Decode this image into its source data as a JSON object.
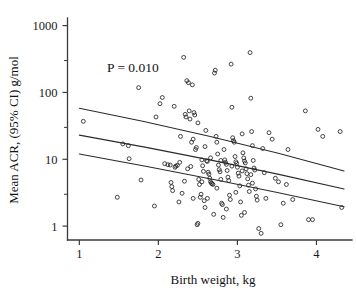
{
  "chart_data": {
    "type": "scatter",
    "title": "",
    "xlabel": "Birth weight, kg",
    "ylabel": "Mean ACR, (95% CI) g/mol",
    "yscale": "log",
    "xscale": "linear",
    "xlim": [
      0.85,
      4.45
    ],
    "ylim": [
      0.62,
      1300
    ],
    "grid": false,
    "legend": null,
    "annotations": [
      {
        "text": "P = 0.010",
        "x": 1.35,
        "y": 200
      }
    ],
    "xticks": [
      1,
      2,
      3,
      4
    ],
    "xtick_labels": [
      "1",
      "2",
      "3",
      "4"
    ],
    "yticks": [
      1,
      10,
      100,
      1000
    ],
    "ytick_labels": [
      "1",
      "10",
      "100",
      "1000"
    ],
    "yminor_ticks": [
      3,
      30,
      300
    ],
    "marker": "open-circle",
    "marker_size": 3,
    "series": [
      {
        "name": "Observations",
        "type": "scatter",
        "points": [
          [
            1.05,
            37
          ],
          [
            1.48,
            2.7
          ],
          [
            1.55,
            17
          ],
          [
            1.62,
            16
          ],
          [
            1.63,
            10.2
          ],
          [
            1.75,
            118
          ],
          [
            1.78,
            4.9
          ],
          [
            1.95,
            2.0
          ],
          [
            1.97,
            43
          ],
          [
            2.02,
            68
          ],
          [
            2.05,
            84
          ],
          [
            2.08,
            8.6
          ],
          [
            2.12,
            8.3
          ],
          [
            2.15,
            8.2
          ],
          [
            2.16,
            4.5
          ],
          [
            2.17,
            3.9
          ],
          [
            2.18,
            3.4
          ],
          [
            2.2,
            62
          ],
          [
            2.22,
            7.9
          ],
          [
            2.24,
            8.1
          ],
          [
            2.26,
            2.3
          ],
          [
            2.28,
            22
          ],
          [
            2.3,
            3.1
          ],
          [
            2.32,
            335
          ],
          [
            2.34,
            47
          ],
          [
            2.35,
            43
          ],
          [
            2.36,
            150
          ],
          [
            2.38,
            140
          ],
          [
            2.39,
            53
          ],
          [
            2.4,
            40
          ],
          [
            2.41,
            7.8
          ],
          [
            2.42,
            18
          ],
          [
            2.43,
            130
          ],
          [
            2.44,
            2.6
          ],
          [
            2.45,
            50
          ],
          [
            2.46,
            46
          ],
          [
            2.47,
            14
          ],
          [
            2.48,
            15
          ],
          [
            2.49,
            1.05
          ],
          [
            2.5,
            1.1
          ],
          [
            2.51,
            5.0
          ],
          [
            2.52,
            4.2
          ],
          [
            2.53,
            2.7
          ],
          [
            2.54,
            3.0
          ],
          [
            2.55,
            4.6
          ],
          [
            2.56,
            8.0
          ],
          [
            2.57,
            6.6
          ],
          [
            2.58,
            2.4
          ],
          [
            2.59,
            1.9
          ],
          [
            2.6,
            27
          ],
          [
            2.61,
            9.5
          ],
          [
            2.62,
            9.3
          ],
          [
            2.63,
            6.4
          ],
          [
            2.64,
            6.0
          ],
          [
            2.65,
            5.2
          ],
          [
            2.66,
            4.6
          ],
          [
            2.67,
            4.4
          ],
          [
            2.68,
            4.3
          ],
          [
            2.69,
            4.2
          ],
          [
            2.7,
            1.5
          ],
          [
            2.71,
            195
          ],
          [
            2.72,
            215
          ],
          [
            2.73,
            22
          ],
          [
            2.74,
            18
          ],
          [
            2.75,
            12
          ],
          [
            2.76,
            8.2
          ],
          [
            2.77,
            7.0
          ],
          [
            2.78,
            6.5
          ],
          [
            2.79,
            5.0
          ],
          [
            2.8,
            2.2
          ],
          [
            2.81,
            2.1
          ],
          [
            2.82,
            1.35
          ],
          [
            2.83,
            14
          ],
          [
            2.84,
            9.8
          ],
          [
            2.85,
            9.0
          ],
          [
            2.86,
            8.4
          ],
          [
            2.87,
            6.8
          ],
          [
            2.88,
            5.4
          ],
          [
            2.89,
            4.8
          ],
          [
            2.9,
            2.9
          ],
          [
            2.91,
            2.5
          ],
          [
            2.92,
            265
          ],
          [
            2.93,
            60
          ],
          [
            2.94,
            21
          ],
          [
            2.95,
            19
          ],
          [
            2.96,
            18
          ],
          [
            2.97,
            11
          ],
          [
            2.98,
            9.2
          ],
          [
            2.99,
            8.7
          ],
          [
            3.0,
            7.6
          ],
          [
            3.01,
            6.2
          ],
          [
            3.02,
            5.6
          ],
          [
            3.03,
            4.0
          ],
          [
            3.04,
            2.3
          ],
          [
            3.05,
            1.45
          ],
          [
            3.06,
            24
          ],
          [
            3.07,
            12.5
          ],
          [
            3.08,
            10.5
          ],
          [
            3.09,
            9.4
          ],
          [
            3.1,
            8.8
          ],
          [
            3.11,
            7.2
          ],
          [
            3.12,
            6.1
          ],
          [
            3.13,
            5.1
          ],
          [
            3.14,
            4.1
          ],
          [
            3.15,
            3.3
          ],
          [
            3.16,
            395
          ],
          [
            3.17,
            82
          ],
          [
            3.18,
            26
          ],
          [
            3.19,
            16
          ],
          [
            3.2,
            9.6
          ],
          [
            3.21,
            7.4
          ],
          [
            3.22,
            6.9
          ],
          [
            3.23,
            3.6
          ],
          [
            3.24,
            2.8
          ],
          [
            3.25,
            2.45
          ],
          [
            3.27,
            0.92
          ],
          [
            3.3,
            0.78
          ],
          [
            3.32,
            14.5
          ],
          [
            3.34,
            6.3
          ],
          [
            3.36,
            2.6
          ],
          [
            3.4,
            25
          ],
          [
            3.44,
            20
          ],
          [
            3.48,
            5.2
          ],
          [
            3.52,
            4.6
          ],
          [
            3.55,
            1.05
          ],
          [
            3.58,
            2.2
          ],
          [
            3.62,
            4.2
          ],
          [
            3.64,
            14
          ],
          [
            3.7,
            2.5
          ],
          [
            3.86,
            53
          ],
          [
            3.9,
            1.25
          ],
          [
            3.95,
            1.25
          ],
          [
            4.02,
            28
          ],
          [
            4.08,
            22
          ],
          [
            4.3,
            26
          ],
          [
            4.32,
            1.9
          ],
          [
            2.21,
            7.6
          ],
          [
            2.33,
            4.7
          ],
          [
            2.44,
            20
          ],
          [
            2.62,
            2.6
          ],
          [
            2.74,
            3.7
          ],
          [
            2.86,
            1.8
          ],
          [
            2.98,
            3.2
          ],
          [
            3.09,
            1.6
          ],
          [
            3.19,
            4.4
          ],
          [
            2.27,
            9.0
          ],
          [
            2.37,
            7.2
          ],
          [
            2.55,
            9.8
          ],
          [
            2.66,
            10.5
          ],
          [
            2.79,
            9.6
          ],
          [
            2.93,
            7.9
          ],
          [
            3.06,
            6.7
          ],
          [
            3.17,
            5.9
          ],
          [
            2.5,
            35
          ],
          [
            2.59,
            15.5
          ]
        ]
      },
      {
        "name": "Fitted regression",
        "type": "line",
        "points": [
          [
            1.0,
            23.0
          ],
          [
            4.35,
            3.6
          ]
        ]
      },
      {
        "name": "Upper 95% CI",
        "type": "line",
        "points": [
          [
            1.0,
            58.0
          ],
          [
            4.35,
            6.7
          ]
        ]
      },
      {
        "name": "Lower 95% CI",
        "type": "line",
        "points": [
          [
            1.0,
            12.0
          ],
          [
            4.35,
            1.95
          ]
        ]
      }
    ]
  },
  "colors": {
    "axis": "#3a3a3a",
    "marker_stroke": "#242424",
    "line": "#2a2a2a",
    "text": "#111111",
    "background": "#ffffff"
  }
}
